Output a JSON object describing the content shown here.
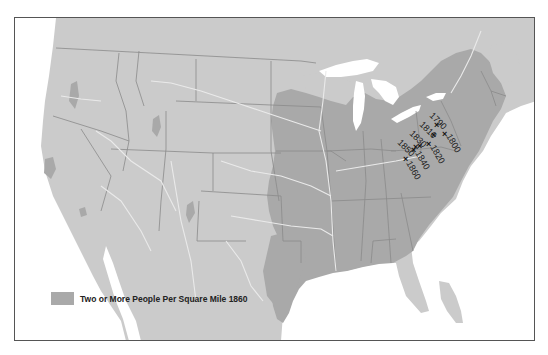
{
  "map": {
    "subject": "United States population density 1860 with center of population markers",
    "colors": {
      "land": "#cbcbcb",
      "dense_population": "#a9a9a9",
      "water": "#ffffff",
      "state_borders": "#8a8a8a",
      "rivers": "#eaeaea",
      "frame": "#555555"
    },
    "legend": {
      "label": "Two or More People Per Square Mile 1860",
      "swatch_color": "#a9a9a9"
    },
    "population_center_markers": [
      {
        "year": "1790",
        "x": 436,
        "y": 124
      },
      {
        "year": "1800",
        "x": 444,
        "y": 133
      },
      {
        "year": "1810",
        "x": 433,
        "y": 134
      },
      {
        "year": "1820",
        "x": 428,
        "y": 143
      },
      {
        "year": "1830",
        "x": 419,
        "y": 144
      },
      {
        "year": "1840",
        "x": 415,
        "y": 146
      },
      {
        "year": "1850",
        "x": 414,
        "y": 149
      },
      {
        "year": "1860",
        "x": 405,
        "y": 158
      }
    ]
  }
}
